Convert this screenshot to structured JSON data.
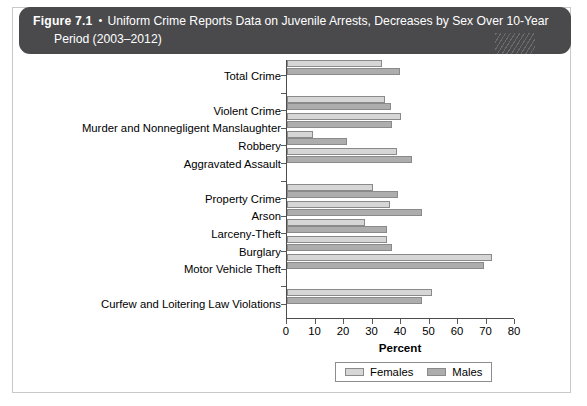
{
  "figure": {
    "number": "Figure 7.1",
    "bullet": "•",
    "title_line1": "Uniform Crime Reports Data on Juvenile Arrests, Decreases by Sex Over 10-Year",
    "title_line2": "Period (2003–2012)"
  },
  "colors": {
    "header_bg": "#4a4a4c",
    "females": "#d6d6d6",
    "males": "#adadad",
    "axis": "#4c4c4c",
    "frame": "#c9c9c9"
  },
  "chart_data": {
    "type": "bar",
    "orientation": "horizontal",
    "title": "Uniform Crime Reports Data on Juvenile Arrests, Decreases by Sex Over 10-Year Period (2003–2012)",
    "xlabel": "Percent",
    "ylabel": "",
    "xlim": [
      0,
      80
    ],
    "xticks": [
      0,
      10,
      20,
      30,
      40,
      50,
      60,
      70,
      80
    ],
    "grid": false,
    "legend_position": "bottom-center",
    "categories": [
      "Total Crime",
      "",
      "Violent Crime",
      "Murder and Nonnegligent Manslaughter",
      "Robbery",
      "Aggravated Assault",
      "",
      "Property Crime",
      "Arson",
      "Larceny-Theft",
      "Burglary",
      "Motor Vehicle Theft",
      "",
      "Curfew and Loitering Law Violations"
    ],
    "series": [
      {
        "name": "Females",
        "values": [
          33.5,
          null,
          34.5,
          40.0,
          9.0,
          38.5,
          null,
          30.0,
          36.0,
          27.5,
          35.0,
          72.0,
          null,
          51.0
        ]
      },
      {
        "name": "Males",
        "values": [
          39.5,
          null,
          36.5,
          37.0,
          21.0,
          44.0,
          null,
          39.0,
          47.5,
          35.0,
          37.0,
          69.0,
          null,
          47.5
        ]
      }
    ]
  },
  "legend": {
    "items": [
      {
        "label": "Females",
        "swatch": "females"
      },
      {
        "label": "Males",
        "swatch": "males"
      }
    ]
  }
}
